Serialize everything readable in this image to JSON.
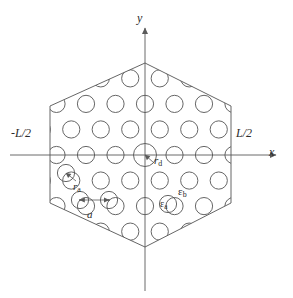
{
  "figure": {
    "type": "photonic-crystal-hexagonal-lattice-diagram",
    "axes": {
      "x_label": "x",
      "y_label": "y"
    },
    "boundary_labels": {
      "left": "-L/2",
      "right": "L/2"
    },
    "annotations": {
      "defect_radius": "r",
      "defect_radius_sub": "d",
      "air_hole_radius": "r",
      "air_hole_radius_sub": "a",
      "lattice_constant": "a",
      "permittivity_hole": "ε",
      "permittivity_hole_sub": "a",
      "permittivity_background": "ε",
      "permittivity_background_sub": "b"
    },
    "colors": {
      "stroke": "#555555",
      "axis": "#6b6b6b",
      "text": "#2a2a2a",
      "background": "#ffffff"
    },
    "geometry": {
      "hexagon_vertices": [
        [
          145,
          63
        ],
        [
          231,
          106
        ],
        [
          231,
          203
        ],
        [
          145,
          247
        ],
        [
          50,
          203
        ],
        [
          50,
          106
        ]
      ],
      "origin": [
        145,
        155
      ],
      "lattice_constant_px": 29.5,
      "hole_radius_px": 8.6,
      "defect_radius_px": 11.5,
      "x_axis": {
        "x1": 10,
        "x2": 283,
        "y": 155
      },
      "y_axis": {
        "y1": 22,
        "y2": 291,
        "x": 145
      },
      "scale_bar_a": {
        "x1": 76,
        "x2": 110,
        "y": 200
      }
    }
  }
}
